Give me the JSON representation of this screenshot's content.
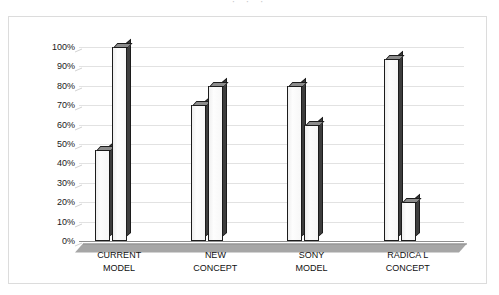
{
  "figure": {
    "frame_border_color": "#dcdcdc",
    "background": "#ffffff",
    "title_remnant": "· · ·"
  },
  "chart_data": {
    "type": "bar",
    "title": "",
    "subtitle": "",
    "xlabel": "",
    "ylabel": "",
    "ylim": [
      0,
      100
    ],
    "y_unit": "%",
    "grid": true,
    "legend": "none",
    "style": "3d-clustered-column",
    "categories": [
      "CURRENT MODEL",
      "NEW CONCEPT",
      "SONY MODEL",
      "RADICAL CONCEPT"
    ],
    "category_lines": [
      [
        "CURRENT",
        "MODEL"
      ],
      [
        "NEW",
        "CONCEPT"
      ],
      [
        "SONY",
        "MODEL"
      ],
      [
        "RADICA L",
        "CONCEPT"
      ]
    ],
    "series": [
      {
        "name": "Series 1",
        "values": [
          47,
          70,
          80,
          94
        ]
      },
      {
        "name": "Series 2",
        "values": [
          100,
          80,
          60,
          20
        ]
      }
    ],
    "ticks": [
      {
        "value": 100,
        "label": "100%"
      },
      {
        "value": 90,
        "label": "90%"
      },
      {
        "value": 80,
        "label": "80%"
      },
      {
        "value": 70,
        "label": "70%"
      },
      {
        "value": 60,
        "label": "60%"
      },
      {
        "value": 50,
        "label": "50%"
      },
      {
        "value": 40,
        "label": "40%"
      },
      {
        "value": 30,
        "label": "30%"
      },
      {
        "value": 20,
        "label": "20%"
      },
      {
        "value": 10,
        "label": "10%"
      },
      {
        "value": 0,
        "label": "0%"
      }
    ],
    "colors": {
      "bar_face": "#fbfbfb",
      "bar_outline": "#1c1c1c",
      "bar_side": "#3d3d3d",
      "bar_top": "#8c8c8c",
      "gridline": "#e2e2e2",
      "axis": "#8f8f8f",
      "floor": "#a8a8a8",
      "text": "#111111"
    }
  }
}
